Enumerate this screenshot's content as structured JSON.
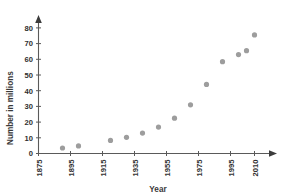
{
  "chart_data": {
    "type": "scatter",
    "title": "",
    "xlabel": "Year",
    "ylabel": "Number in millions",
    "xlim": [
      1875,
      2010
    ],
    "ylim": [
      0,
      85
    ],
    "grid": false,
    "legend": null,
    "xticks": [
      "1875",
      "1895",
      "1915",
      "1935",
      "1955",
      "1975",
      "1995",
      "2010"
    ],
    "xtick_values": [
      1875,
      1895,
      1915,
      1935,
      1955,
      1975,
      1995,
      2010
    ],
    "yticks": [
      "0",
      "10",
      "20",
      "30",
      "40",
      "50",
      "60",
      "70",
      "80"
    ],
    "ytick_values": [
      0,
      10,
      20,
      30,
      40,
      50,
      60,
      70,
      80
    ],
    "marker": "filled-circle",
    "marker_color": "#9d9d9d",
    "axis_color": "#5a5a5a",
    "x": [
      1890,
      1900,
      1920,
      1930,
      1940,
      1950,
      1960,
      1970,
      1980,
      1990,
      2000,
      2005,
      2010
    ],
    "values": [
      3.5,
      4.8,
      8.3,
      10.3,
      13.0,
      16.8,
      22.5,
      31.0,
      44.0,
      58.5,
      63.0,
      65.5,
      75.5
    ],
    "points": [
      {
        "x": 1890,
        "y": 3.5
      },
      {
        "x": 1900,
        "y": 4.8
      },
      {
        "x": 1920,
        "y": 8.3
      },
      {
        "x": 1930,
        "y": 10.3
      },
      {
        "x": 1940,
        "y": 13.0
      },
      {
        "x": 1950,
        "y": 16.8
      },
      {
        "x": 1960,
        "y": 22.5
      },
      {
        "x": 1970,
        "y": 31.0
      },
      {
        "x": 1980,
        "y": 44.0
      },
      {
        "x": 1990,
        "y": 58.5
      },
      {
        "x": 2000,
        "y": 63.0
      },
      {
        "x": 2005,
        "y": 65.5
      },
      {
        "x": 2010,
        "y": 75.5
      }
    ]
  },
  "axes": {
    "y_title": "Number in millions",
    "x_title": "Year"
  }
}
